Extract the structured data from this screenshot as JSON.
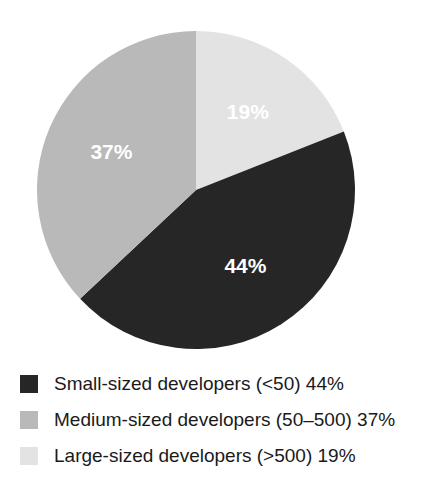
{
  "chart_data": {
    "type": "pie",
    "title": "",
    "subtitle": "",
    "xlabel": "",
    "ylabel": "",
    "grid": false,
    "legend_position": "bottom-left",
    "start_angle_deg": 0,
    "direction": "clockwise",
    "units": "percent",
    "categories": [
      "Small-sized developers (<50)",
      "Medium-sized developers (50–500)",
      "Large-sized developers (>500)"
    ],
    "values": [
      44,
      37,
      19
    ],
    "data_labels": [
      "44%",
      "37%",
      "19%"
    ],
    "colors": [
      "#262626",
      "#b9b9b9",
      "#e3e3e3"
    ],
    "slices": [
      {
        "name": "Small-sized developers (<50)",
        "value": 44,
        "label": "44%",
        "color": "#262626",
        "label_color": "#ffffff"
      },
      {
        "name": "Medium-sized developers (50–500)",
        "value": 37,
        "label": "37%",
        "color": "#b9b9b9",
        "label_color": "#ffffff"
      },
      {
        "name": "Large-sized developers (>500)",
        "value": 19,
        "label": "19%",
        "color": "#e3e3e3",
        "label_color": "#ffffff"
      }
    ]
  },
  "pie": {
    "labels": {
      "large": "19%",
      "medium": "37%",
      "small": "44%"
    }
  },
  "legend": {
    "items": [
      {
        "label": "Small-sized developers (<50) 44%",
        "color": "#262626",
        "swatch_name": "legend-swatch-small"
      },
      {
        "label": "Medium-sized developers (50–500) 37%",
        "color": "#b9b9b9",
        "swatch_name": "legend-swatch-medium"
      },
      {
        "label": "Large-sized developers (>500) 19%",
        "color": "#e3e3e3",
        "swatch_name": "legend-swatch-large"
      }
    ]
  }
}
